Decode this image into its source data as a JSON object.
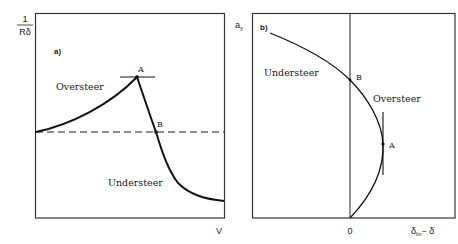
{
  "panel_a": {
    "label": "a)",
    "y_axis_label_numerator": "1",
    "y_axis_label_denominator": "Rδ",
    "x_axis_label": "V",
    "region_labels": {
      "oversteer": "Oversteer",
      "understeer": "Understeer"
    },
    "points": {
      "a": "A",
      "b": "B"
    }
  },
  "panel_b": {
    "label": "b)",
    "y_axis_label_base": "a",
    "y_axis_label_sub": "y",
    "x_axis_origin": "0",
    "x_axis_label_base": "δ",
    "x_axis_label_sub": "lin",
    "x_axis_label_rest": "− δ",
    "region_labels": {
      "understeer": "Understeer",
      "oversteer": "Oversteer"
    },
    "points": {
      "a": "A",
      "b": "B"
    }
  },
  "colors": {
    "line": "#1a1a1a",
    "frame": "#333333",
    "background": "#ffffff"
  }
}
